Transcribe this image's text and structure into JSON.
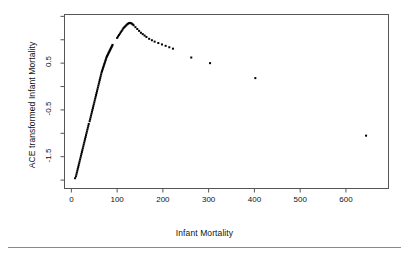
{
  "figure": {
    "background": "#ffffff",
    "ink": "#111111",
    "rule_color": "#8a8a8a"
  },
  "chart_data": {
    "type": "scatter",
    "title": "",
    "xlabel": "Infant Mortality",
    "ylabel": "ACE transformed Infant Mortality",
    "xlim": [
      -15,
      693
    ],
    "ylim": [
      -2.18,
      1.54
    ],
    "grid": false,
    "legend": null,
    "box": true,
    "marker": "filled-square",
    "marker_color": "#000000",
    "marker_size_px": 2,
    "xticks": [
      0,
      100,
      200,
      300,
      400,
      500,
      600
    ],
    "xtick_labels": [
      "0",
      "100",
      "200",
      "300",
      "400",
      "500",
      "600"
    ],
    "yticks": [
      -1.5,
      -0.5,
      0.5
    ],
    "ytick_labels": [
      "-1.5",
      "-0.5",
      "0.5"
    ],
    "yticks_minor": [
      -2.0,
      -1.0,
      0.0,
      1.0,
      1.5
    ],
    "series": [
      {
        "name": "ACE transform",
        "x": [
          8,
          10,
          11,
          12,
          13,
          14,
          15,
          16,
          17,
          18,
          19,
          20,
          21,
          22,
          23,
          24,
          25,
          26,
          27,
          28,
          29,
          30,
          31,
          32,
          33,
          34,
          35,
          36,
          37,
          38,
          40,
          41,
          42,
          43,
          44,
          45,
          46,
          47,
          48,
          49,
          50,
          51,
          52,
          53,
          54,
          55,
          56,
          57,
          58,
          59,
          60,
          61,
          62,
          63,
          64,
          65,
          66,
          67,
          68,
          69,
          70,
          71,
          72,
          73,
          74,
          75,
          76,
          77,
          78,
          79,
          80,
          81,
          82,
          83,
          84,
          85,
          86,
          87,
          88,
          89,
          90,
          100,
          102,
          104,
          106,
          108,
          110,
          112,
          114,
          116,
          118,
          120,
          122,
          124,
          126,
          128,
          130,
          132,
          134,
          136,
          140,
          144,
          148,
          152,
          156,
          160,
          164,
          170,
          176,
          182,
          190,
          198,
          206,
          214,
          222,
          262,
          303,
          402,
          644
        ],
        "y": [
          -1.96,
          -1.92,
          -1.88,
          -1.84,
          -1.8,
          -1.76,
          -1.72,
          -1.68,
          -1.64,
          -1.6,
          -1.56,
          -1.52,
          -1.48,
          -1.44,
          -1.4,
          -1.36,
          -1.32,
          -1.28,
          -1.24,
          -1.2,
          -1.16,
          -1.12,
          -1.08,
          -1.04,
          -1.0,
          -0.96,
          -0.92,
          -0.88,
          -0.84,
          -0.8,
          -0.74,
          -0.7,
          -0.66,
          -0.62,
          -0.58,
          -0.54,
          -0.5,
          -0.46,
          -0.42,
          -0.38,
          -0.34,
          -0.3,
          -0.26,
          -0.22,
          -0.18,
          -0.14,
          -0.1,
          -0.06,
          -0.02,
          0.02,
          0.06,
          0.1,
          0.14,
          0.18,
          0.22,
          0.26,
          0.3,
          0.33,
          0.36,
          0.39,
          0.42,
          0.45,
          0.48,
          0.51,
          0.54,
          0.57,
          0.6,
          0.63,
          0.65,
          0.67,
          0.69,
          0.71,
          0.73,
          0.75,
          0.77,
          0.79,
          0.81,
          0.83,
          0.85,
          0.87,
          0.89,
          1.04,
          1.07,
          1.1,
          1.13,
          1.16,
          1.19,
          1.22,
          1.25,
          1.27,
          1.29,
          1.31,
          1.33,
          1.345,
          1.355,
          1.36,
          1.355,
          1.345,
          1.33,
          1.31,
          1.27,
          1.23,
          1.19,
          1.15,
          1.12,
          1.09,
          1.06,
          1.02,
          0.99,
          0.96,
          0.93,
          0.9,
          0.87,
          0.84,
          0.81,
          0.62,
          0.5,
          0.18,
          -1.05
        ]
      }
    ]
  },
  "axis_titles": {
    "x": "Infant Mortality",
    "y": "ACE transformed Infant Mortality"
  }
}
